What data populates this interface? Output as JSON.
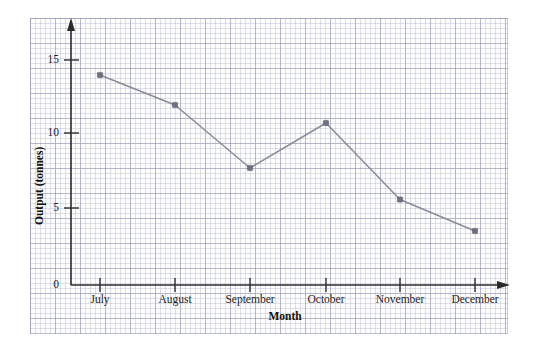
{
  "chart_data": {
    "type": "line",
    "title": "",
    "xlabel": "Month",
    "ylabel": "Output (tonnes)",
    "categories": [
      "July",
      "August",
      "September",
      "October",
      "November",
      "December"
    ],
    "values": [
      14,
      12,
      7.8,
      10.8,
      5.7,
      3.6
    ],
    "series": [
      {
        "name": "Output",
        "values": [
          14,
          12,
          7.8,
          10.8,
          5.7,
          3.6
        ]
      }
    ],
    "ylim": [
      0,
      17
    ],
    "yticks": [
      0,
      5,
      10,
      15
    ],
    "ytick_labels": [
      "0",
      "5",
      "10",
      "15"
    ],
    "xtick_labels": [
      "July",
      "August",
      "September",
      "October",
      "November",
      "December"
    ],
    "grid": true,
    "grid_style": "graph-paper",
    "legend": "none",
    "marker": "square",
    "line_color": "#8a8a99",
    "marker_color": "#6f6f80",
    "axis_color": "#2b2b2b",
    "background_color": "#fdfdfd",
    "annotations": []
  },
  "axes": {
    "y_title": "Output (tonnes)",
    "x_title": "Month",
    "y_ticks": [
      {
        "label": "15",
        "value": 15
      },
      {
        "label": "10",
        "value": 10
      },
      {
        "label": "5",
        "value": 5
      },
      {
        "label": "0",
        "value": 0
      }
    ],
    "x_ticks": [
      {
        "label": "July"
      },
      {
        "label": "August"
      },
      {
        "label": "September"
      },
      {
        "label": "October"
      },
      {
        "label": "November"
      },
      {
        "label": "December"
      }
    ]
  }
}
